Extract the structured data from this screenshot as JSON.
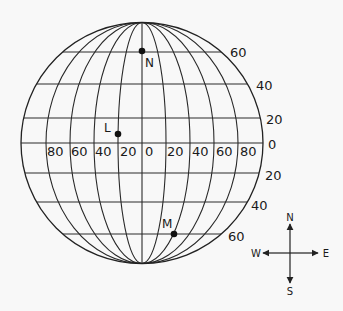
{
  "globe": {
    "center": [
      142,
      143
    ],
    "radius_x": 121,
    "radius_y": 120.5,
    "meridian_spacing_px": 24,
    "meridian_degrees": [
      -80,
      -60,
      -40,
      -20,
      0,
      20,
      40,
      60,
      80
    ],
    "line_color": "#2a2a2a",
    "background": "#f8f8f8"
  },
  "latitudes": [
    {
      "deg": 60,
      "hemisphere": "N",
      "y": 52,
      "label": "60",
      "label_x": 230,
      "label_y": 57
    },
    {
      "deg": 40,
      "hemisphere": "N",
      "y": 84,
      "label": "40",
      "label_x": 256,
      "label_y": 90
    },
    {
      "deg": 20,
      "hemisphere": "N",
      "y": 118,
      "label": "20",
      "label_x": 266,
      "label_y": 124
    },
    {
      "deg": 0,
      "hemisphere": "",
      "y": 143,
      "label": "0",
      "label_x": 268,
      "label_y": 149
    },
    {
      "deg": 20,
      "hemisphere": "S",
      "y": 173,
      "label": "20",
      "label_x": 265,
      "label_y": 180
    },
    {
      "deg": 40,
      "hemisphere": "S",
      "y": 202,
      "label": "40",
      "label_x": 251,
      "label_y": 210
    },
    {
      "deg": 60,
      "hemisphere": "S",
      "y": 234,
      "label": "60",
      "label_x": 228,
      "label_y": 241
    }
  ],
  "longitude_labels": [
    {
      "label": "80",
      "x": 47
    },
    {
      "label": "60",
      "x": 71
    },
    {
      "label": "40",
      "x": 95
    },
    {
      "label": "20",
      "x": 120
    },
    {
      "label": "0",
      "x": 145
    },
    {
      "label": "20",
      "x": 167
    },
    {
      "label": "40",
      "x": 192
    },
    {
      "label": "60",
      "x": 216
    },
    {
      "label": "80",
      "x": 240
    }
  ],
  "longitude_label_y": 156,
  "points": [
    {
      "name": "N",
      "label": "N",
      "x": 142,
      "y": 51,
      "label_x": 145,
      "label_y": 67,
      "lat": "60N",
      "lon": "0"
    },
    {
      "name": "L",
      "label": "L",
      "x": 118,
      "y": 134,
      "label_x": 104,
      "label_y": 132,
      "lat": "~5N",
      "lon": "20W"
    },
    {
      "name": "M",
      "label": "M",
      "x": 174,
      "y": 234,
      "label_x": 162,
      "label_y": 228,
      "lat": "60S",
      "lon": "40E"
    }
  ],
  "compass": {
    "center": [
      290,
      253
    ],
    "north": "N",
    "south": "S",
    "east": "E",
    "west": "W"
  }
}
